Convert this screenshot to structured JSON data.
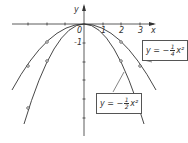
{
  "figure": {
    "axes": {
      "x_label": "x",
      "y_label": "y",
      "origin_label": "0",
      "x_ticks": [
        "1",
        "2",
        "3"
      ],
      "y_ticks": [
        "-1"
      ],
      "origin_px": [
        84,
        24
      ],
      "unit_px": 18.7
    },
    "curves": [
      {
        "name": "y=-1/4x^2",
        "a": -0.25,
        "marked_points": [
          [
            -3,
            -2.25
          ],
          [
            -2,
            -1
          ],
          [
            2,
            -1
          ],
          [
            3,
            -2.25
          ]
        ]
      },
      {
        "name": "y=-1/2x^2",
        "a": -0.5,
        "marked_points": [
          [
            -3,
            -4.5
          ],
          [
            -2,
            -2
          ],
          [
            2,
            -2
          ],
          [
            3,
            -4.5
          ]
        ]
      }
    ],
    "label_quarter": {
      "prefix": "y = −",
      "num": "1",
      "den": "4",
      "suffix": "x²"
    },
    "label_half": {
      "prefix": "y = −",
      "num": "1",
      "den": "2",
      "suffix": "x²"
    },
    "colors": {
      "stroke": "#333333",
      "background": "#ffffff"
    }
  }
}
